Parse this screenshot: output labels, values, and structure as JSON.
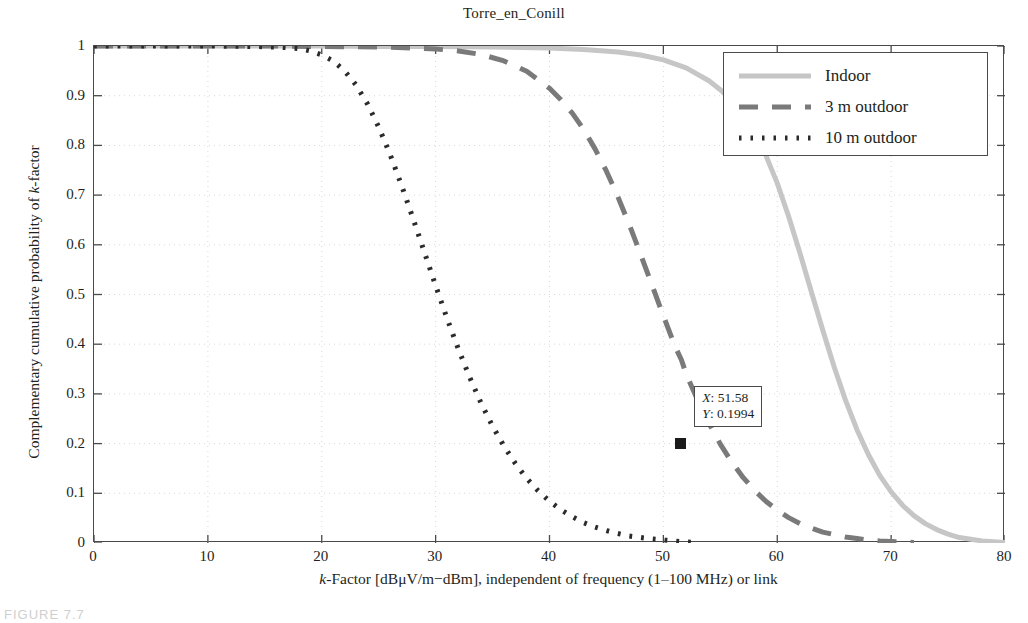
{
  "figure": {
    "caption": "FIGURE 7.7"
  },
  "chart_data": {
    "type": "line",
    "title": "Torre_en_Conill",
    "xlabel": "k-Factor [dBμV/m−dBm], independent of frequency (1–100 MHz) or link",
    "ylabel": "Complementary cumulative probability of k-factor",
    "xlim": [
      0,
      80
    ],
    "ylim": [
      0,
      1
    ],
    "xticks": [
      0,
      10,
      20,
      30,
      40,
      50,
      60,
      70,
      80
    ],
    "yticks": [
      0,
      0.1,
      0.2,
      0.3,
      0.4,
      0.5,
      0.6,
      0.7,
      0.8,
      0.9,
      1
    ],
    "xtick_labels": [
      "0",
      "10",
      "20",
      "30",
      "40",
      "50",
      "60",
      "70",
      "80"
    ],
    "ytick_labels": [
      "0",
      "0.1",
      "0.2",
      "0.3",
      "0.4",
      "0.5",
      "0.6",
      "0.7",
      "0.8",
      "0.9",
      "1"
    ],
    "grid": true,
    "grid_style": "dotted",
    "legend_position": "top-right",
    "series": [
      {
        "name": "Indoor",
        "style": "solid",
        "color": "#c6c6c6",
        "width": 5,
        "x": [
          0,
          5,
          10,
          15,
          20,
          25,
          30,
          35,
          40,
          43,
          46,
          48,
          50,
          52,
          54,
          55,
          56,
          57,
          58,
          59,
          60,
          61,
          62,
          63,
          64,
          65,
          66,
          67,
          68,
          69,
          70,
          71,
          72,
          73,
          74,
          75,
          76,
          78,
          80
        ],
        "y": [
          1,
          1,
          1,
          1,
          1,
          0.999,
          0.999,
          0.998,
          0.996,
          0.993,
          0.988,
          0.982,
          0.972,
          0.956,
          0.93,
          0.912,
          0.89,
          0.862,
          0.826,
          0.78,
          0.724,
          0.657,
          0.583,
          0.505,
          0.428,
          0.354,
          0.287,
          0.228,
          0.178,
          0.136,
          0.103,
          0.076,
          0.055,
          0.039,
          0.027,
          0.018,
          0.011,
          0.004,
          0.001
        ]
      },
      {
        "name": "3 m outdoor",
        "style": "dashed",
        "color": "#7a7a7a",
        "width": 5,
        "x": [
          0,
          5,
          10,
          15,
          20,
          25,
          28,
          30,
          32,
          34,
          36,
          38,
          40,
          41,
          42,
          43,
          44,
          45,
          46,
          47,
          48,
          49,
          50,
          51,
          51.58,
          52,
          53,
          54,
          55,
          56,
          57,
          58,
          59,
          60,
          61,
          62,
          63,
          64,
          65,
          66,
          67,
          68,
          69,
          70,
          71,
          72
        ],
        "y": [
          1,
          1,
          1,
          1,
          0.999,
          0.998,
          0.996,
          0.994,
          0.99,
          0.983,
          0.97,
          0.949,
          0.915,
          0.892,
          0.865,
          0.832,
          0.793,
          0.748,
          0.697,
          0.641,
          0.581,
          0.519,
          0.457,
          0.397,
          0.3688,
          0.34,
          0.288,
          0.241,
          0.199,
          0.163,
          0.132,
          0.106,
          0.084,
          0.066,
          0.051,
          0.039,
          0.03,
          0.022,
          0.017,
          0.012,
          0.009,
          0.006,
          0.004,
          0.003,
          0.002,
          0.001
        ]
      },
      {
        "name": "10 m outdoor",
        "style": "dotted",
        "color": "#2b2b2b",
        "width": 5,
        "x": [
          0,
          5,
          10,
          14,
          16,
          18,
          19,
          20,
          21,
          22,
          23,
          24,
          25,
          26,
          27,
          28,
          29,
          30,
          31,
          32,
          33,
          34,
          35,
          36,
          37,
          38,
          39,
          40,
          41,
          42,
          43,
          44,
          45,
          46,
          47,
          48,
          49,
          50,
          51,
          52,
          53
        ],
        "y": [
          1,
          1,
          1,
          0.999,
          0.998,
          0.995,
          0.99,
          0.982,
          0.97,
          0.95,
          0.922,
          0.884,
          0.837,
          0.782,
          0.72,
          0.654,
          0.586,
          0.518,
          0.452,
          0.39,
          0.333,
          0.281,
          0.235,
          0.195,
          0.16,
          0.13,
          0.105,
          0.084,
          0.067,
          0.053,
          0.041,
          0.032,
          0.025,
          0.019,
          0.014,
          0.011,
          0.008,
          0.006,
          0.004,
          0.002,
          0.001
        ]
      }
    ],
    "annotation": {
      "x_label": "X",
      "x_value": "51.58",
      "y_label": "Y",
      "y_value": "0.1994",
      "x_line": "X: 51.58",
      "y_line": "Y: 0.1994",
      "marker_x": 51.58,
      "marker_y": 0.1994
    }
  },
  "legend": {
    "items": [
      {
        "label": "Indoor"
      },
      {
        "label": "3 m outdoor"
      },
      {
        "label": "10 m outdoor"
      }
    ]
  },
  "axis_title_parts": {
    "x_pre": "k",
    "x_post": "-Factor [dBμV/m−dBm], independent of frequency (1–100 MHz) or link",
    "y_pre": "Complementary cumulative probability of ",
    "y_ital": "k",
    "y_post": "-factor"
  }
}
